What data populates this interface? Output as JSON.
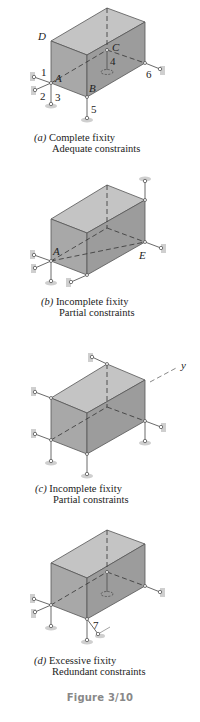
{
  "figure": {
    "title": "Figure 3/10",
    "panels": [
      {
        "id": "a",
        "tag": "(a)",
        "caption_line1": "Complete fixity",
        "caption_line2": "Adequate constraints",
        "point_labels": [
          "A",
          "B",
          "C",
          "D"
        ],
        "link_labels": [
          "1",
          "2",
          "3",
          "4",
          "5",
          "6"
        ]
      },
      {
        "id": "b",
        "tag": "(b)",
        "caption_line1": "Incomplete fixity",
        "caption_line2": "Partial constraints",
        "point_labels": [
          "A",
          "E"
        ]
      },
      {
        "id": "c",
        "tag": "(c)",
        "caption_line1": "Incomplete fixity",
        "caption_line2": "Partial constraints",
        "axis_label": "y"
      },
      {
        "id": "d",
        "tag": "(d)",
        "caption_line1": "Excessive fixity",
        "caption_line2": "Redundant constraints",
        "link_labels": [
          "7"
        ]
      }
    ]
  },
  "colors": {
    "box_front": "#a9a9a9",
    "box_top": "#c4c4c4",
    "box_side": "#9a9a9a",
    "edge": "#555555",
    "support": "#cfcfcf",
    "caption_text": "#222222",
    "figure_label": "#888888"
  }
}
